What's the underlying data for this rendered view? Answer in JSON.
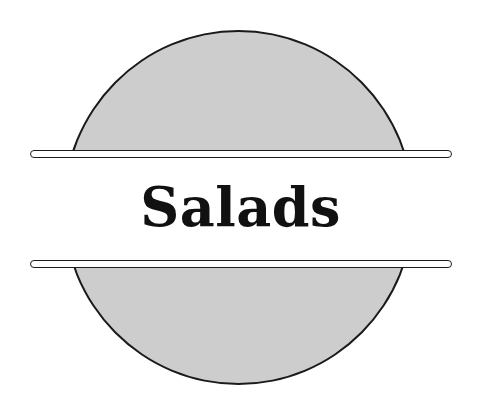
{
  "page": {
    "width": 481,
    "height": 413,
    "background_color": "#ffffff"
  },
  "graphic": {
    "kind": "section-divider-badge",
    "disc": {
      "name": "gray-circle",
      "fill_color": "#cdcdcd",
      "stroke_color": "#1a1a1a",
      "stroke_width": 2,
      "center_x": 238,
      "center_y": 207,
      "diameter": 353
    },
    "rules": [
      {
        "name": "top-rule",
        "fill_color": "#ffffff",
        "stroke_color": "#1c1c1c",
        "x_start": 30,
        "x_end": 452,
        "y": 154,
        "thickness": 8,
        "cap": "rounded"
      },
      {
        "name": "bottom-rule",
        "fill_color": "#ffffff",
        "stroke_color": "#1c1c1c",
        "x_start": 30,
        "x_end": 452,
        "y": 264,
        "thickness": 8,
        "cap": "rounded"
      }
    ]
  },
  "title": {
    "text": "Salads",
    "color": "#111111",
    "style": "bold-serif-didone",
    "font_size": 54
  }
}
